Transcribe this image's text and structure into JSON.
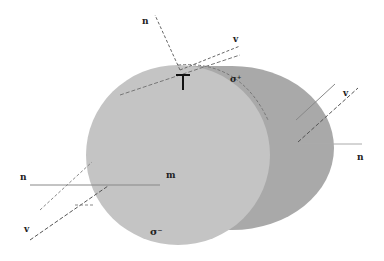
{
  "diagram": {
    "labels": {
      "n_top": "n",
      "v_top": "v",
      "sigma_top": "σ⁺",
      "tau_top": "Γ",
      "n_left": "n",
      "v_left": "v",
      "center": "m",
      "sigma_bottom": "σ⁻",
      "v_right": "v",
      "n_right": "n"
    },
    "colors": {
      "face": "#c4c4c4",
      "side": "#a8a8a8",
      "line": "#666666",
      "text": "#222222"
    }
  }
}
